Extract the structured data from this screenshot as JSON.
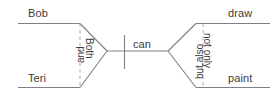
{
  "diagram": {
    "type": "correlative-conjunction-bracket-diagram",
    "sentence": "Both Bob and Teri can not only draw but also paint",
    "colors": {
      "line": "#808080",
      "dashed_line": "#a0a0a0",
      "text": "#3c3c3c",
      "background": "#ffffff"
    },
    "labels": {
      "top_left": "Bob",
      "bottom_left": "Teri",
      "left_inner_dashed": "and",
      "left_bracket": "Both",
      "center": "can",
      "right_bracket": "but also",
      "right_inner_dashed": "not only",
      "top_right": "draw",
      "bottom_right": "paint"
    }
  }
}
